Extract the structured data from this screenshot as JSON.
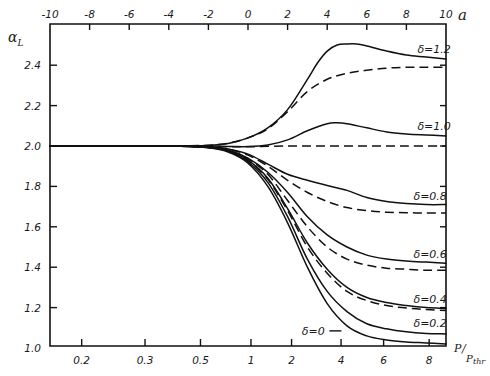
{
  "chart_data": {
    "type": "line",
    "title": "",
    "ylabel": "α_L",
    "xlabel_top": "a",
    "xlabel_bottom": "P/P_thr",
    "xlim_top": [
      -10,
      10
    ],
    "ylim": [
      1.0,
      2.5
    ],
    "grid": false,
    "legend": "none (inline curve labels at right)",
    "top_ticks": [
      {
        "value": -10,
        "label": "-10"
      },
      {
        "value": -8,
        "label": "-8"
      },
      {
        "value": -6,
        "label": "-6"
      },
      {
        "value": -4,
        "label": "-4"
      },
      {
        "value": -2,
        "label": "-2"
      },
      {
        "value": 0,
        "label": "0"
      },
      {
        "value": 2,
        "label": "2"
      },
      {
        "value": 4,
        "label": "4"
      },
      {
        "value": 6,
        "label": "6"
      },
      {
        "value": 8,
        "label": "8"
      },
      {
        "value": 10,
        "label": "10"
      }
    ],
    "y_ticks": [
      {
        "value": 1.0,
        "label": "1.0"
      },
      {
        "value": 1.2,
        "label": "1.2"
      },
      {
        "value": 1.4,
        "label": "1.4"
      },
      {
        "value": 1.6,
        "label": "1.6"
      },
      {
        "value": 1.8,
        "label": "1.8"
      },
      {
        "value": 2.0,
        "label": "2.0"
      },
      {
        "value": 2.2,
        "label": "2.2"
      },
      {
        "value": 2.4,
        "label": "2.4"
      }
    ],
    "bottom_ticks": [
      {
        "a": -8.4,
        "label": "0.2"
      },
      {
        "a": -5.2,
        "label": "0.3"
      },
      {
        "a": -2.4,
        "label": "0.5"
      },
      {
        "a": 0.15,
        "label": "1"
      },
      {
        "a": 2.2,
        "label": "2"
      },
      {
        "a": 4.7,
        "label": "4"
      },
      {
        "a": 6.85,
        "label": "6"
      },
      {
        "a": 9.15,
        "label": "8"
      }
    ],
    "series": [
      {
        "name": "δ=1.2",
        "style": "solid",
        "x": [
          -10,
          -4,
          -2,
          -1,
          0,
          1,
          2,
          3,
          3.5,
          4,
          4.5,
          5,
          5.5,
          6,
          7,
          8,
          9,
          10
        ],
        "y": [
          2.0,
          2.0,
          2.003,
          2.012,
          2.04,
          2.09,
          2.18,
          2.33,
          2.41,
          2.47,
          2.5,
          2.505,
          2.505,
          2.495,
          2.47,
          2.45,
          2.44,
          2.43
        ]
      },
      {
        "name": "δ=1.2 (dashed)",
        "style": "dashed",
        "x": [
          -10,
          -4,
          -2,
          -1,
          0,
          1,
          2,
          3,
          4,
          5,
          6,
          7,
          8,
          9,
          10
        ],
        "y": [
          2.0,
          2.0,
          2.004,
          2.014,
          2.04,
          2.085,
          2.17,
          2.27,
          2.33,
          2.36,
          2.375,
          2.385,
          2.39,
          2.39,
          2.39
        ]
      },
      {
        "name": "δ=1.0",
        "style": "solid",
        "x": [
          -10,
          -4,
          -2,
          -1,
          0,
          1,
          2,
          3,
          4,
          4.5,
          5,
          6,
          7,
          8,
          9,
          10
        ],
        "y": [
          2.0,
          2.0,
          2.0,
          1.998,
          1.997,
          2.005,
          2.03,
          2.075,
          2.11,
          2.115,
          2.11,
          2.09,
          2.07,
          2.06,
          2.055,
          2.05
        ]
      },
      {
        "name": "δ=1.0 (dashed)",
        "style": "dashed",
        "x": [
          -10,
          -4,
          -2,
          -1,
          0,
          2,
          4,
          6,
          8,
          10
        ],
        "y": [
          2.0,
          2.0,
          1.998,
          1.996,
          1.996,
          2.0,
          2.0,
          2.0,
          2.0,
          2.0
        ]
      },
      {
        "name": "δ=0.8",
        "style": "solid",
        "x": [
          -10,
          -4,
          -2,
          -1,
          0,
          1,
          2,
          3,
          4,
          5,
          6,
          7,
          8,
          9,
          10
        ],
        "y": [
          2.0,
          2.0,
          1.995,
          1.985,
          1.96,
          1.91,
          1.86,
          1.83,
          1.805,
          1.78,
          1.745,
          1.725,
          1.715,
          1.71,
          1.71
        ]
      },
      {
        "name": "δ=0.8 (dashed)",
        "style": "dashed",
        "x": [
          -10,
          -4,
          -2,
          -1,
          0,
          1,
          2,
          3,
          4,
          5,
          6,
          7,
          8,
          9,
          10
        ],
        "y": [
          2.0,
          2.0,
          1.995,
          1.984,
          1.955,
          1.9,
          1.83,
          1.77,
          1.725,
          1.695,
          1.68,
          1.672,
          1.67,
          1.668,
          1.668
        ]
      },
      {
        "name": "δ=0.6",
        "style": "solid",
        "x": [
          -10,
          -4,
          -2,
          -1,
          0,
          1,
          2,
          3,
          4,
          5,
          6,
          7,
          8,
          9,
          10
        ],
        "y": [
          2.0,
          2.0,
          1.994,
          1.98,
          1.94,
          1.87,
          1.77,
          1.65,
          1.56,
          1.5,
          1.46,
          1.44,
          1.43,
          1.425,
          1.42
        ]
      },
      {
        "name": "δ=0.6 (dashed)",
        "style": "dashed",
        "x": [
          -10,
          -4,
          -2,
          -1,
          0,
          1,
          2,
          3,
          4,
          5,
          6,
          7,
          8,
          9,
          10
        ],
        "y": [
          2.0,
          2.0,
          1.994,
          1.978,
          1.935,
          1.86,
          1.73,
          1.6,
          1.5,
          1.44,
          1.41,
          1.395,
          1.39,
          1.385,
          1.385
        ]
      },
      {
        "name": "δ=0.4",
        "style": "solid",
        "x": [
          -10,
          -4,
          -2,
          -1,
          0,
          1,
          2,
          3,
          4,
          5,
          6,
          7,
          8,
          9,
          10
        ],
        "y": [
          2.0,
          2.0,
          1.993,
          1.976,
          1.93,
          1.84,
          1.69,
          1.52,
          1.39,
          1.3,
          1.25,
          1.225,
          1.21,
          1.2,
          1.195
        ]
      },
      {
        "name": "δ=0.4 (dashed)",
        "style": "dashed",
        "x": [
          -10,
          -4,
          -2,
          -1,
          0,
          1,
          2,
          3,
          4,
          5,
          6,
          7,
          8,
          9,
          10
        ],
        "y": [
          2.0,
          2.0,
          1.993,
          1.975,
          1.928,
          1.835,
          1.68,
          1.5,
          1.37,
          1.28,
          1.235,
          1.21,
          1.198,
          1.19,
          1.185
        ]
      },
      {
        "name": "δ=0.2",
        "style": "solid",
        "x": [
          -10,
          -4,
          -2,
          -1,
          0,
          1,
          2,
          3,
          4,
          5,
          6,
          7,
          8,
          9,
          10
        ],
        "y": [
          2.0,
          2.0,
          1.992,
          1.973,
          1.922,
          1.82,
          1.65,
          1.44,
          1.28,
          1.18,
          1.12,
          1.095,
          1.08,
          1.072,
          1.07
        ]
      },
      {
        "name": "δ=0",
        "style": "solid",
        "x": [
          -10,
          -4,
          -2,
          -1,
          0,
          1,
          2,
          3,
          4,
          5,
          6,
          7,
          8,
          9,
          10
        ],
        "y": [
          2.0,
          2.0,
          1.991,
          1.97,
          1.915,
          1.8,
          1.62,
          1.4,
          1.22,
          1.11,
          1.06,
          1.04,
          1.03,
          1.025,
          1.02
        ]
      }
    ],
    "annotations": [
      {
        "text": "δ=1.2",
        "a": 9.4,
        "y": 2.46
      },
      {
        "text": "δ=1.0",
        "a": 9.4,
        "y": 2.08
      },
      {
        "text": "δ=0.8",
        "a": 9.2,
        "y": 1.735
      },
      {
        "text": "δ=0.6",
        "a": 9.2,
        "y": 1.445
      },
      {
        "text": "δ=0.4",
        "a": 9.2,
        "y": 1.225
      },
      {
        "text": "δ=0.2",
        "a": 9.2,
        "y": 1.105
      },
      {
        "text": "δ=0",
        "a": 3.3,
        "y": 1.065
      }
    ]
  }
}
